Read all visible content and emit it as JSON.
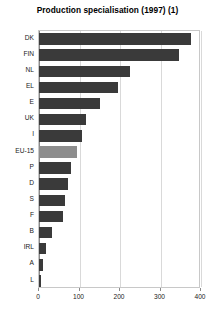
{
  "chart_data": {
    "type": "bar",
    "orientation": "horizontal",
    "title": "Production specialisation (1997) (1)",
    "xlabel": "",
    "ylabel": "",
    "categories": [
      "DK",
      "FIN",
      "NL",
      "EL",
      "E",
      "UK",
      "I",
      "EU-15",
      "P",
      "D",
      "S",
      "F",
      "B",
      "IRL",
      "A",
      "L"
    ],
    "values": [
      375,
      345,
      225,
      195,
      150,
      115,
      105,
      95,
      80,
      72,
      65,
      60,
      32,
      18,
      10,
      6
    ],
    "xlim": [
      0,
      400
    ],
    "xticks": [
      0,
      100,
      200,
      300,
      400
    ],
    "xtick_labels": [
      "0",
      "100",
      "200",
      "300",
      "400"
    ],
    "grid": true,
    "legend": "none",
    "highlight_category": "EU-15",
    "bar_color": "#3a3a3a",
    "highlight_color": "#8d8d8d",
    "frame_color": "#c8c8c8",
    "grid_color": "#d9d9d9"
  }
}
